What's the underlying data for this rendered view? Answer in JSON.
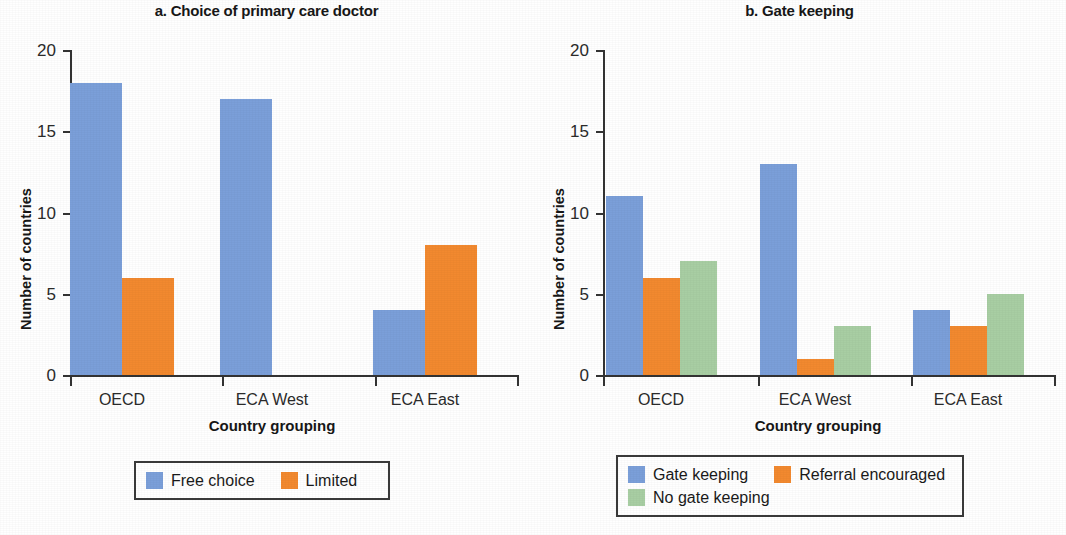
{
  "figure": {
    "ylabel": "Number of countries",
    "xlabel": "Country grouping",
    "y_ticks": [
      "0",
      "5",
      "10",
      "15",
      "20"
    ]
  },
  "colors": {
    "blue": "#7b9fd9",
    "orange": "#f2892f",
    "green": "#a8cea3",
    "axis": "#333333",
    "text": "#1a1a1a"
  },
  "panel_a": {
    "title": "a. Choice of primary care doctor",
    "ylabel": "Number of countries",
    "xlabel": "Country grouping",
    "categories": [
      "OECD",
      "ECA West",
      "ECA East"
    ],
    "legend": [
      {
        "label": "Free choice",
        "color": "#7b9fd9"
      },
      {
        "label": "Limited",
        "color": "#f2892f"
      }
    ]
  },
  "panel_b": {
    "title": "b. Gate keeping",
    "ylabel": "Number of countries",
    "xlabel": "Country grouping",
    "categories": [
      "OECD",
      "ECA West",
      "ECA East"
    ],
    "legend": [
      {
        "label": "Gate keeping",
        "color": "#7b9fd9"
      },
      {
        "label": "Referral encouraged",
        "color": "#f2892f"
      },
      {
        "label": "No gate keeping",
        "color": "#a8cea3"
      }
    ]
  },
  "chart_data": [
    {
      "type": "bar",
      "title": "a. Choice of primary care doctor",
      "xlabel": "Country grouping",
      "ylabel": "Number of countries",
      "ylim": [
        0,
        20
      ],
      "yticks": [
        0,
        5,
        10,
        15,
        20
      ],
      "grid": false,
      "legend_position": "bottom",
      "categories": [
        "OECD",
        "ECA West",
        "ECA East"
      ],
      "series": [
        {
          "name": "Free choice",
          "color": "#7b9fd9",
          "values": [
            18,
            17,
            4
          ]
        },
        {
          "name": "Limited",
          "color": "#f2892f",
          "values": [
            6,
            0,
            8
          ]
        }
      ]
    },
    {
      "type": "bar",
      "title": "b. Gate keeping",
      "xlabel": "Country grouping",
      "ylabel": "Number of countries",
      "ylim": [
        0,
        20
      ],
      "yticks": [
        0,
        5,
        10,
        15,
        20
      ],
      "grid": false,
      "legend_position": "bottom",
      "categories": [
        "OECD",
        "ECA West",
        "ECA East"
      ],
      "series": [
        {
          "name": "Gate keeping",
          "color": "#7b9fd9",
          "values": [
            11,
            13,
            4
          ]
        },
        {
          "name": "Referral encouraged",
          "color": "#f2892f",
          "values": [
            6,
            1,
            3
          ]
        },
        {
          "name": "No gate keeping",
          "color": "#a8cea3",
          "values": [
            7,
            3,
            5
          ]
        }
      ]
    }
  ]
}
